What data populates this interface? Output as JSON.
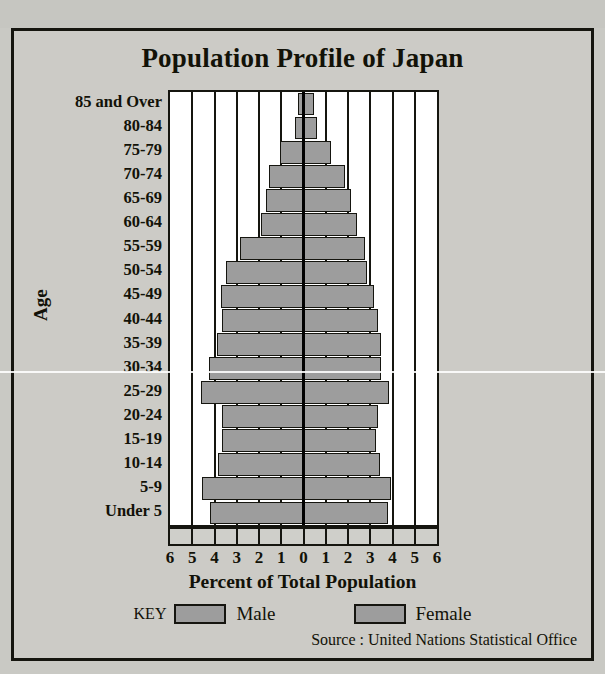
{
  "figure": {
    "title": "Population Profile of Japan",
    "y_axis_title": "Age",
    "x_axis_title": "Percent of Total Population",
    "source": "Source : United Nations Statistical Office",
    "colors": {
      "bar_fill": "#9d9d9d",
      "bar_outline": "#15150f",
      "plot_background": "#ffffff",
      "page_background": "#c9c9c4",
      "panel_background": "#cccbc6",
      "text": "#121208"
    }
  },
  "legend": {
    "key_label": "KEY",
    "entries": [
      {
        "label": "Male",
        "swatch": "#9d9d9d"
      },
      {
        "label": "Female",
        "swatch": "#9d9d9d"
      }
    ]
  },
  "chart_data": {
    "type": "bar",
    "subtype": "population-pyramid",
    "title": "Population Profile of Japan",
    "xlabel": "Percent of Total Population",
    "ylabel": "Age",
    "grid": true,
    "legend_position": "bottom",
    "xlim": [
      -6,
      6
    ],
    "xticks": [
      6,
      5,
      4,
      3,
      2,
      1,
      0,
      1,
      2,
      3,
      4,
      5,
      6
    ],
    "xtick_values": [
      -6,
      -5,
      -4,
      -3,
      -2,
      -1,
      0,
      1,
      2,
      3,
      4,
      5,
      6
    ],
    "categories": [
      "85 and Over",
      "80-84",
      "75-79",
      "70-74",
      "65-69",
      "60-64",
      "55-59",
      "50-54",
      "45-49",
      "40-44",
      "35-39",
      "30-34",
      "25-29",
      "20-24",
      "15-19",
      "10-14",
      "5-9",
      "Under 5"
    ],
    "series": [
      {
        "name": "Male",
        "direction": "left",
        "values": [
          0.25,
          0.4,
          1.05,
          1.55,
          1.7,
          1.9,
          2.85,
          3.5,
          3.7,
          3.65,
          3.9,
          4.25,
          4.6,
          3.65,
          3.65,
          3.85,
          4.55,
          4.2
        ]
      },
      {
        "name": "Female",
        "direction": "right",
        "values": [
          0.45,
          0.6,
          1.25,
          1.85,
          2.15,
          2.4,
          2.75,
          2.85,
          3.15,
          3.35,
          3.5,
          3.5,
          3.85,
          3.35,
          3.25,
          3.45,
          3.95,
          3.8
        ]
      }
    ]
  }
}
